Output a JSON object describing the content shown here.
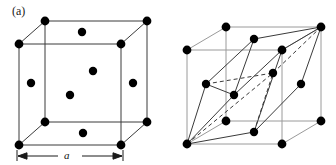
{
  "figure": {
    "background_color": "#ffffff",
    "line_color": "#3a3a3a",
    "atom_color": "#000000",
    "label_color": "#1a1a1a",
    "atom_radius": 4.2,
    "width": 336,
    "height": 165
  },
  "panels": [
    {
      "id": "a",
      "label": "(a)",
      "caption_label": "(a)",
      "structure": "face-centered-cubic-unit-cell",
      "dimension": {
        "label": "a",
        "symbol": "a",
        "start_x": 17,
        "end_x": 123,
        "y": 156,
        "tick_height": 5
      },
      "cube": {
        "front_face": [
          [
            19,
            44
          ],
          [
            121,
            44
          ],
          [
            121,
            145
          ],
          [
            19,
            145
          ]
        ],
        "back_offset": [
          26,
          -23
        ],
        "back_face": [
          [
            45,
            21
          ],
          [
            147,
            21
          ],
          [
            147,
            122
          ],
          [
            45,
            122
          ]
        ]
      },
      "corner_atoms": [
        [
          19,
          44
        ],
        [
          121,
          44
        ],
        [
          19,
          145
        ],
        [
          121,
          145
        ],
        [
          45,
          21
        ],
        [
          147,
          21
        ],
        [
          45,
          122
        ],
        [
          147,
          122
        ]
      ],
      "face_center_atoms": [
        {
          "face": "top",
          "x": 82,
          "y": 32
        },
        {
          "face": "bottom",
          "x": 83,
          "y": 133
        },
        {
          "face": "left",
          "x": 31,
          "y": 83
        },
        {
          "face": "right",
          "x": 133,
          "y": 83
        },
        {
          "face": "front",
          "x": 70,
          "y": 95
        },
        {
          "face": "back",
          "x": 93,
          "y": 71
        }
      ]
    },
    {
      "id": "b",
      "label": "(b)",
      "caption_label": "(b)",
      "structure": "primitive-rhombohedral-cell-in-fcc",
      "cube": {
        "front_face": [
          [
            187,
            50
          ],
          [
            282,
            50
          ],
          [
            282,
            144
          ],
          [
            187,
            144
          ]
        ],
        "back_offset": [
          39,
          -23
        ],
        "back_face": [
          [
            226,
            27
          ],
          [
            321,
            27
          ],
          [
            321,
            121
          ],
          [
            226,
            121
          ]
        ]
      },
      "corner_atoms": [
        [
          187,
          50
        ],
        [
          282,
          50
        ],
        [
          187,
          144
        ],
        [
          282,
          144
        ],
        [
          226,
          27
        ],
        [
          321,
          27
        ],
        [
          226,
          121
        ],
        [
          321,
          121
        ]
      ],
      "face_center_atoms": [
        {
          "face": "top",
          "x": 254,
          "y": 39
        },
        {
          "face": "bottom",
          "x": 254,
          "y": 132
        },
        {
          "face": "left",
          "x": 206,
          "y": 84
        },
        {
          "face": "right",
          "x": 301,
          "y": 84
        },
        {
          "face": "front",
          "x": 234,
          "y": 95
        },
        {
          "face": "back",
          "x": 273,
          "y": 73
        }
      ],
      "rhombohedron": {
        "origin": [
          187,
          144
        ],
        "apex": [
          321,
          27
        ],
        "solid_edges": [
          [
            [
              187,
              144
            ],
            [
              254,
              132
            ]
          ],
          [
            [
              187,
              144
            ],
            [
              206,
              84
            ]
          ],
          [
            [
              187,
              144
            ],
            [
              234,
              95
            ]
          ],
          [
            [
              254,
              132
            ],
            [
              301,
              84
            ]
          ],
          [
            [
              206,
              84
            ],
            [
              254,
              39
            ]
          ],
          [
            [
              234,
              95
            ],
            [
              282,
              50
            ]
          ],
          [
            [
              254,
              39
            ],
            [
              321,
              27
            ]
          ],
          [
            [
              301,
              84
            ],
            [
              321,
              27
            ]
          ],
          [
            [
              206,
              84
            ],
            [
              234,
              95
            ]
          ],
          [
            [
              254,
              132
            ],
            [
              282,
              50
            ]
          ],
          [
            [
              282,
              50
            ],
            [
              321,
              27
            ]
          ],
          [
            [
              234,
              95
            ],
            [
              254,
              39
            ]
          ]
        ],
        "dashed_edges": [
          [
            [
              187,
              144
            ],
            [
              273,
              73
            ]
          ],
          [
            [
              206,
              84
            ],
            [
              273,
              73
            ]
          ],
          [
            [
              273,
              73
            ],
            [
              321,
              27
            ]
          ],
          [
            [
              254,
              132
            ],
            [
              273,
              73
            ]
          ]
        ]
      }
    }
  ]
}
